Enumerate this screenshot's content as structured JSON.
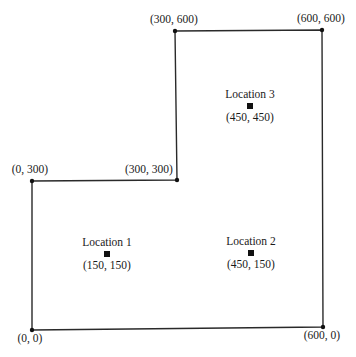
{
  "diagram": {
    "type": "floor-plan",
    "colors": {
      "line": "#2a2a2a",
      "marker": "#111111",
      "text": "#1a1a1a",
      "background": "#ffffff"
    },
    "vertices": [
      {
        "label": "(0, 0)",
        "x": 0,
        "y": 0,
        "px": 32,
        "py": 330,
        "lx": 30,
        "ly": 342,
        "anchor": "middle"
      },
      {
        "label": "(600, 0)",
        "x": 600,
        "y": 0,
        "px": 323,
        "py": 327,
        "lx": 322,
        "ly": 339,
        "anchor": "middle"
      },
      {
        "label": "(600, 600)",
        "x": 600,
        "y": 600,
        "px": 322,
        "py": 30,
        "lx": 321,
        "ly": 22,
        "anchor": "middle"
      },
      {
        "label": "(300, 600)",
        "x": 300,
        "y": 600,
        "px": 175,
        "py": 31,
        "lx": 174,
        "ly": 23,
        "anchor": "middle"
      },
      {
        "label": "(300, 300)",
        "x": 300,
        "y": 300,
        "px": 177,
        "py": 180,
        "lx": 149,
        "ly": 173,
        "anchor": "middle"
      },
      {
        "label": "(0, 300)",
        "x": 0,
        "y": 300,
        "px": 32,
        "py": 181,
        "lx": 30,
        "ly": 173,
        "anchor": "middle"
      }
    ],
    "locations": [
      {
        "name": "Location 1",
        "coords": "(150, 150)",
        "x": 150,
        "y": 150,
        "px": 107,
        "py": 254
      },
      {
        "name": "Location 2",
        "coords": "(450, 150)",
        "x": 450,
        "y": 150,
        "px": 251,
        "py": 253
      },
      {
        "name": "Location 3",
        "coords": "(450, 450)",
        "x": 450,
        "y": 450,
        "px": 250,
        "py": 106
      }
    ]
  }
}
